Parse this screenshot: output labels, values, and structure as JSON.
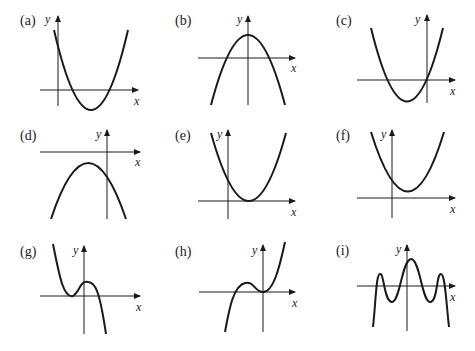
{
  "figure": {
    "axis_x_label": "x",
    "axis_y_label": "y",
    "stroke_color": "#1a1a1a",
    "panels": [
      {
        "label": "(a)",
        "description": "upward parabola, positive y-intercept, vertex below x-axis to the right of y-axis, two positive roots"
      },
      {
        "label": "(b)",
        "description": "downward parabola, vertex on y-axis above x-axis, symmetric roots"
      },
      {
        "label": "(c)",
        "description": "upward parabola through origin, vertex left of y-axis below x-axis"
      },
      {
        "label": "(d)",
        "description": "downward parabola entirely below x-axis, vertex left of y-axis"
      },
      {
        "label": "(e)",
        "description": "upward parabola tangent to x-axis at positive x, positive y-intercept"
      },
      {
        "label": "(f)",
        "description": "upward parabola entirely above x-axis, vertex right of y-axis"
      },
      {
        "label": "(g)",
        "description": "cubic, negative leading coefficient, double root at negative x, local max right of y-axis"
      },
      {
        "label": "(h)",
        "description": "cubic, positive leading coefficient, double root at origin, local max at negative x"
      },
      {
        "label": "(i)",
        "description": "quartic-like curve with three local maxima and two local minima, ends going down"
      }
    ]
  }
}
